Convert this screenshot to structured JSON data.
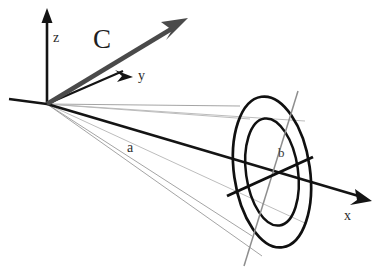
{
  "figure": {
    "type": "3d-vector-diagram",
    "background_color": "#ffffff",
    "width": 379,
    "height": 271
  },
  "axes": {
    "origin": {
      "x": 47,
      "y": 104
    },
    "items": [
      {
        "name": "z",
        "label": "z",
        "label_x": 58,
        "label_y": 38,
        "direction": "up",
        "color": "#141414",
        "tip_x": 47,
        "tip_y": 10
      },
      {
        "name": "y",
        "label": "y",
        "label_x": 141,
        "label_y": 80,
        "direction": "up-right",
        "color": "#141414",
        "tip_x": 132,
        "tip_y": 77
      },
      {
        "name": "x",
        "label": "x",
        "label_x": 344,
        "label_y": 220,
        "direction": "down-right",
        "color": "#141414",
        "tip_x": 371,
        "tip_y": 201
      }
    ]
  },
  "vectors": [
    {
      "name": "C",
      "label": "C",
      "label_x": 93,
      "label_y": 48,
      "color": "#4a4a4a",
      "start_x": 47,
      "start_y": 104,
      "tip_x": 187,
      "tip_y": 19,
      "style": "thick-gray-arrow"
    }
  ],
  "measures": [
    {
      "name": "a",
      "label": "a",
      "label_x": 127,
      "label_y": 152,
      "description": "distance along axis from origin to disk center",
      "color": "#2b2b2b"
    },
    {
      "name": "b",
      "label": "b",
      "label_x": 282,
      "label_y": 153,
      "description": "radius-like dimension marked across the annular disk",
      "color": "#2b2b2b"
    }
  ],
  "disk": {
    "name": "annulus",
    "center_x": 272,
    "center_y": 172,
    "outer_rx": 38,
    "outer_ry": 76,
    "inner_rx": 26,
    "inner_ry": 54,
    "rotation_deg": -8,
    "stroke_color": "#101010"
  },
  "cone": {
    "ray_color": "#9a9a9a",
    "apex_x": 47,
    "apex_y": 104,
    "ray_count": 4
  },
  "chords": [
    {
      "name": "chord-b-thick",
      "x1": 227,
      "y1": 196,
      "x2": 313,
      "y2": 157,
      "color": "#101010",
      "weight": "thick"
    },
    {
      "name": "chord-b-thin",
      "x1": 244,
      "y1": 266,
      "x2": 298,
      "y2": 91,
      "color": "#8e8e8e",
      "weight": "thin"
    }
  ]
}
